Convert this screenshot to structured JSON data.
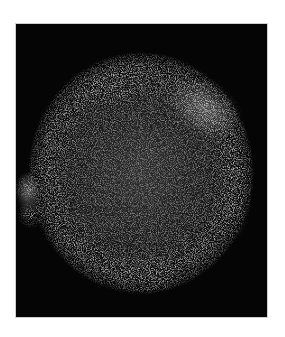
{
  "image": {
    "subject": "supernova remnant (X-ray image)",
    "background_color": "#ffffff",
    "frame_color": "#050505",
    "border_color": "#cfcfcf",
    "remnant": {
      "center_x": 126,
      "center_y": 148,
      "radius_x": 112,
      "radius_y": 120,
      "shell_color": "#bdbdbd",
      "bright_regions": [
        {
          "label": "northeast-rim",
          "cx": 190,
          "cy": 85
        },
        {
          "label": "northwest-rim",
          "cx": 100,
          "cy": 65
        },
        {
          "label": "west-knot-upper",
          "cx": 12,
          "cy": 165
        },
        {
          "label": "west-knot-lower",
          "cx": 15,
          "cy": 190
        },
        {
          "label": "south-rim",
          "cx": 130,
          "cy": 250
        }
      ]
    }
  }
}
